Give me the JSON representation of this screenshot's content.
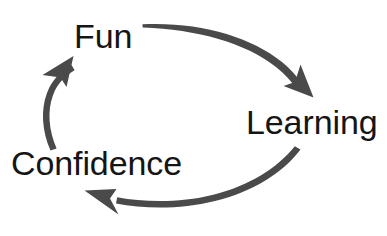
{
  "diagram": {
    "type": "cycle",
    "background_color": "#ffffff",
    "arrow_color": "#4a4a4a",
    "label_color": "#151515",
    "nodes": [
      {
        "id": "fun",
        "label": "Fun",
        "position": "top-left"
      },
      {
        "id": "learning",
        "label": "Learning",
        "position": "right"
      },
      {
        "id": "confidence",
        "label": "Confidence",
        "position": "bottom-left"
      }
    ],
    "edges": [
      {
        "id": "fun-to-learning",
        "from": "Fun",
        "to": "Learning",
        "direction": "clockwise",
        "shape": "curved-arrow"
      },
      {
        "id": "learning-to-confidence",
        "from": "Learning",
        "to": "Confidence",
        "direction": "clockwise",
        "shape": "curved-arrow"
      },
      {
        "id": "confidence-to-fun",
        "from": "Confidence",
        "to": "Fun",
        "direction": "clockwise",
        "shape": "curved-arrow"
      }
    ]
  }
}
